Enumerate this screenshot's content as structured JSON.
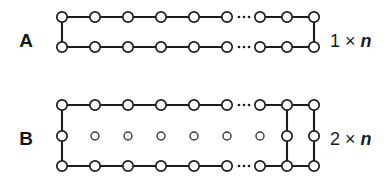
{
  "figure": {
    "background": "#ffffff",
    "ink_color": "#1c1c1c",
    "node_fill": "#ffffff",
    "width": 392,
    "height": 186
  },
  "panels": [
    {
      "id": "panel-a",
      "letter": "A",
      "letter_x": 26,
      "letter_y": 42,
      "size_label_text": "1 × ",
      "size_label_var": "n",
      "size_label_x": 330,
      "size_label_y": 42,
      "geometry": {
        "rows": 2,
        "row_y": [
          17,
          47
        ],
        "node_count_per_row": 9,
        "node_x": [
          62,
          95,
          128,
          161,
          194,
          227,
          260,
          287,
          314
        ],
        "node_radius": 5.2,
        "ellipsis_between_index": [
          5,
          6
        ],
        "ellipsis_dots_x": [
          239,
          244,
          249
        ],
        "vertical_edges_at_x": [
          62,
          314
        ],
        "middle_row": false
      }
    },
    {
      "id": "panel-b",
      "letter": "B",
      "letter_x": 26,
      "letter_y": 140,
      "size_label_text": "2 × ",
      "size_label_var": "n",
      "size_label_x": 330,
      "size_label_y": 140,
      "geometry": {
        "rows": 3,
        "row_y": [
          105,
          136,
          166
        ],
        "node_count_per_row": 9,
        "node_x": [
          62,
          95,
          128,
          161,
          194,
          227,
          260,
          287,
          314
        ],
        "node_radius": 5.2,
        "node_radius_small": 4.0,
        "ellipsis_between_index": [
          5,
          6
        ],
        "ellipsis_dots_x": [
          239,
          244,
          249
        ],
        "vertical_edges_at_x": [
          62,
          287,
          314
        ],
        "middle_row": true,
        "middle_row_connected_x": [
          62,
          287,
          314
        ],
        "middle_row_isolated_x": [
          95,
          128,
          161,
          194,
          227,
          260
        ]
      }
    }
  ],
  "legend": {
    "node_meaning": "vertex",
    "edge_meaning": "edge",
    "ellipsis_meaning": "repetition-continues"
  }
}
